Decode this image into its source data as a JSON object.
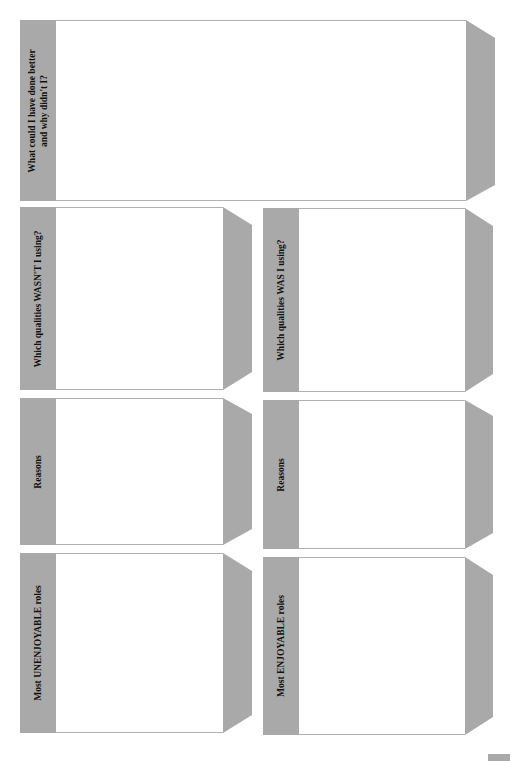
{
  "worksheet": {
    "colors": {
      "label_bg": "#a9a9a9",
      "flap": "#a9a9a9",
      "field_bg": "#ffffff",
      "border": "#b0b0b0"
    },
    "top_box": {
      "label_line1": "What could I have done better",
      "label_line2": "and why didn't I?"
    },
    "left_column": [
      {
        "label": "Which qualities WASN'T I using?"
      },
      {
        "label": "Reasons"
      },
      {
        "label": "Most UNENJOYABLE roles"
      }
    ],
    "right_column": [
      {
        "label": "Which qualities WAS I using?"
      },
      {
        "label": "Reasons"
      },
      {
        "label": "Most ENJOYABLE roles"
      }
    ]
  }
}
